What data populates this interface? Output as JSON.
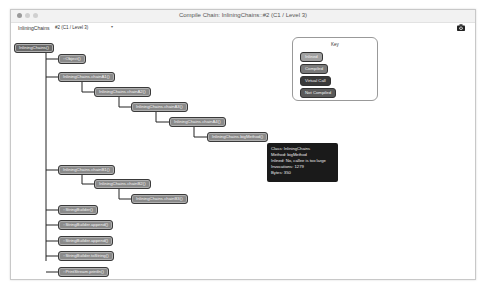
{
  "window": {
    "title": "Compile Chain: InliningChains::#2  (C1 / Level 3)"
  },
  "toolbar": {
    "class_label": "InliningChains",
    "select_value": "#2  (C1 / Level 3)",
    "camera_icon": "camera-icon"
  },
  "tree": {
    "root": "InliningChains()",
    "nodes": [
      {
        "label": "::Object()"
      },
      {
        "label": "InliningChains.chainA1()"
      },
      {
        "label": "InliningChains.chainA2()"
      },
      {
        "label": "InliningChains.chainA3()"
      },
      {
        "label": "InliningChains.chainA4()"
      },
      {
        "label": "InliningChains.bigMethod()"
      },
      {
        "label": "InliningChains.chainB1()"
      },
      {
        "label": "InliningChains.chainB2()"
      },
      {
        "label": "InliningChains.chainB3()"
      },
      {
        "label": "::StringBuilder()"
      },
      {
        "label": "::StringBuilder.append()"
      },
      {
        "label": "::StringBuilder.append()"
      },
      {
        "label": "::StringBuilder.toString()"
      },
      {
        "label": "::PrintStream.println()"
      }
    ]
  },
  "tooltip": {
    "lines": [
      "Class: InliningChains",
      "Method: bigMethod",
      "Inlined: No, callee is too large",
      "Invocations: 1279",
      "Bytes: 350"
    ]
  },
  "key": {
    "title": "Key",
    "items": [
      {
        "label": "Inlined",
        "color": "#a0a0a0"
      },
      {
        "label": "Compiled",
        "color": "#7a7a7a"
      },
      {
        "label": "Virtual Call",
        "color": "#3a3a3a"
      },
      {
        "label": "Not Compiled",
        "color": "#5a5a5a"
      }
    ]
  }
}
